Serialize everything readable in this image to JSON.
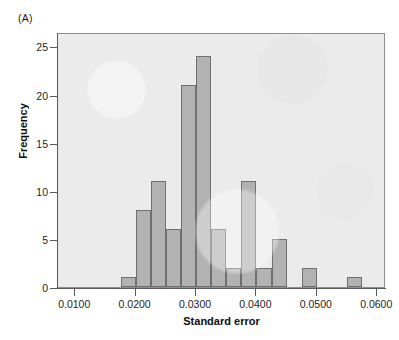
{
  "figure": {
    "panel_label": "(A)"
  },
  "chart_data": {
    "type": "bar",
    "title": "",
    "subtitle": "",
    "xlabel": "Standard error",
    "ylabel": "Frequency",
    "xlim": [
      0.00715,
      0.06145
    ],
    "ylim": [
      0,
      26.5
    ],
    "grid": false,
    "legend": null,
    "bin_width": 0.0025,
    "bin_starts": [
      0.0175,
      0.02,
      0.0225,
      0.025,
      0.0275,
      0.03,
      0.0325,
      0.035,
      0.0375,
      0.04,
      0.0425,
      0.0475,
      0.055
    ],
    "bin_centers": [
      0.01875,
      0.02125,
      0.02375,
      0.02625,
      0.02875,
      0.03125,
      0.03375,
      0.03625,
      0.03875,
      0.04125,
      0.04375,
      0.04875,
      0.05625
    ],
    "categories": [
      "0.0175-0.0200",
      "0.0200-0.0225",
      "0.0225-0.0250",
      "0.0250-0.0275",
      "0.0275-0.0300",
      "0.0300-0.0325",
      "0.0325-0.0350",
      "0.0350-0.0375",
      "0.0375-0.0400",
      "0.0400-0.0425",
      "0.0425-0.0450",
      "0.0475-0.0500",
      "0.0550-0.0575"
    ],
    "values": [
      1,
      8,
      11,
      6,
      21,
      24,
      6,
      2,
      11,
      2,
      5,
      2,
      1
    ],
    "xticks": [
      0.01,
      0.02,
      0.03,
      0.04,
      0.05,
      0.06
    ],
    "xticklabels": [
      "0.0100",
      "0.0200",
      "0.0300",
      "0.0400",
      "0.0500",
      "0.0600"
    ],
    "yticks": [
      0,
      5,
      10,
      15,
      20,
      25
    ],
    "yticklabels": [
      "0",
      "5",
      "10",
      "15",
      "20",
      "25"
    ],
    "colors": {
      "bar_fill": "#b2b2b2",
      "bar_edge": "#6f6f6f",
      "plot_background": "#ebebeb",
      "axis": "#5a5a5a",
      "text": "#1d1d1d",
      "figure_background": "#ffffff"
    }
  }
}
